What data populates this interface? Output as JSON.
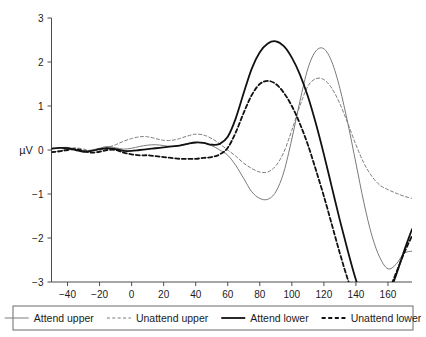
{
  "chart_data": {
    "type": "line",
    "title": "",
    "subtitle": "",
    "xlabel": "",
    "ylabel": "µV",
    "xlim": [
      -50,
      175
    ],
    "ylim": [
      -3,
      3
    ],
    "grid": false,
    "legend_position": "bottom",
    "xticks": [
      -40,
      -20,
      0,
      20,
      40,
      60,
      80,
      100,
      120,
      140,
      160
    ],
    "xtick_labels": [
      "−40",
      "−20",
      "0",
      "20",
      "40",
      "60",
      "80",
      "100",
      "120",
      "140",
      "160"
    ],
    "yticks": [
      -3,
      -2,
      -1,
      0,
      1,
      2,
      3
    ],
    "ytick_labels": [
      "−3",
      "−2",
      "−1",
      "0",
      "1",
      "2",
      "3"
    ],
    "x": [
      -50,
      -45,
      -40,
      -35,
      -30,
      -25,
      -20,
      -15,
      -10,
      -5,
      0,
      5,
      10,
      15,
      20,
      25,
      30,
      35,
      40,
      45,
      50,
      55,
      60,
      65,
      70,
      75,
      80,
      85,
      90,
      95,
      100,
      105,
      110,
      115,
      120,
      125,
      130,
      135,
      140,
      145,
      150,
      155,
      160,
      165,
      170,
      175
    ],
    "series": [
      {
        "name": "Attend upper",
        "color": "#7a7a7a",
        "style": "solid",
        "width": 1.0,
        "values": [
          0.02,
          0.05,
          0.06,
          0.02,
          -0.02,
          0.0,
          0.04,
          0.08,
          0.05,
          0.02,
          0.04,
          0.08,
          0.11,
          0.12,
          0.1,
          0.08,
          0.1,
          0.14,
          0.17,
          0.16,
          0.1,
          0.0,
          -0.12,
          -0.35,
          -0.65,
          -0.95,
          -1.1,
          -1.12,
          -0.95,
          -0.5,
          0.25,
          1.1,
          1.85,
          2.25,
          2.3,
          2.0,
          1.4,
          0.6,
          -0.3,
          -1.2,
          -1.95,
          -2.45,
          -2.7,
          -2.6,
          -2.35,
          -2.3
        ]
      },
      {
        "name": "Unattend upper",
        "color": "#7a7a7a",
        "style": "dashed",
        "width": 1.0,
        "values": [
          -0.04,
          -0.02,
          0.02,
          0.05,
          0.02,
          -0.02,
          0.0,
          0.06,
          0.12,
          0.2,
          0.26,
          0.3,
          0.3,
          0.26,
          0.22,
          0.22,
          0.26,
          0.32,
          0.36,
          0.34,
          0.26,
          0.14,
          0.0,
          -0.14,
          -0.3,
          -0.42,
          -0.5,
          -0.5,
          -0.36,
          -0.05,
          0.45,
          1.0,
          1.45,
          1.62,
          1.6,
          1.4,
          1.05,
          0.6,
          0.12,
          -0.3,
          -0.6,
          -0.8,
          -0.9,
          -0.98,
          -1.05,
          -1.1
        ]
      },
      {
        "name": "Attend lower",
        "color": "#111111",
        "style": "solid",
        "width": 1.8,
        "values": [
          0.03,
          0.05,
          0.04,
          0.0,
          -0.04,
          -0.02,
          0.02,
          0.04,
          0.02,
          -0.02,
          -0.02,
          0.0,
          0.02,
          0.04,
          0.06,
          0.08,
          0.1,
          0.14,
          0.17,
          0.16,
          0.12,
          0.14,
          0.3,
          0.72,
          1.3,
          1.85,
          2.22,
          2.42,
          2.47,
          2.36,
          2.1,
          1.72,
          1.22,
          0.6,
          -0.1,
          -0.85,
          -1.6,
          -2.3,
          -2.95,
          -3.45,
          -3.7,
          -3.6,
          -3.3,
          -2.85,
          -2.3,
          -1.8
        ]
      },
      {
        "name": "Unattend lower",
        "color": "#111111",
        "style": "dashed",
        "width": 1.8,
        "values": [
          -0.05,
          -0.03,
          0.0,
          0.02,
          -0.02,
          -0.06,
          -0.04,
          0.0,
          0.0,
          -0.06,
          -0.1,
          -0.12,
          -0.12,
          -0.14,
          -0.16,
          -0.18,
          -0.2,
          -0.2,
          -0.2,
          -0.18,
          -0.16,
          -0.1,
          0.05,
          0.4,
          0.85,
          1.25,
          1.5,
          1.57,
          1.5,
          1.3,
          1.0,
          0.6,
          0.12,
          -0.45,
          -1.05,
          -1.7,
          -2.35,
          -2.95,
          -3.45,
          -3.75,
          -3.8,
          -3.6,
          -3.25,
          -2.8,
          -2.35,
          -1.95
        ]
      }
    ],
    "legend": [
      {
        "label": "Attend upper",
        "color": "#7a7a7a",
        "style": "solid",
        "width": 1.0
      },
      {
        "label": "Unattend upper",
        "color": "#7a7a7a",
        "style": "dashed",
        "width": 1.0
      },
      {
        "label": "Attend lower",
        "color": "#111111",
        "style": "solid",
        "width": 1.8
      },
      {
        "label": "Unattend lower",
        "color": "#111111",
        "style": "dashed",
        "width": 1.8
      }
    ]
  }
}
